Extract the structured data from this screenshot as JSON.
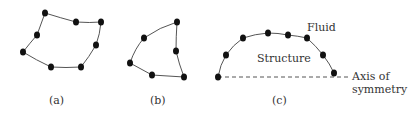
{
  "figure": {
    "panels": [
      {
        "id": "a",
        "caption": "(a)",
        "shape": "quadrilateral element with 8 nodes"
      },
      {
        "id": "b",
        "caption": "(b)",
        "shape": "triangular element with 6 nodes"
      },
      {
        "id": "c",
        "caption": "(c)",
        "shape": "axisymmetric structure boundary with 8 nodes"
      }
    ],
    "labels": {
      "fluid": "Fluid",
      "structure": "Structure",
      "axis_line1": "Axis of",
      "axis_line2": "symmetry"
    },
    "colors": {
      "line": "#555555",
      "node": "#111111",
      "text": "#333333"
    }
  }
}
